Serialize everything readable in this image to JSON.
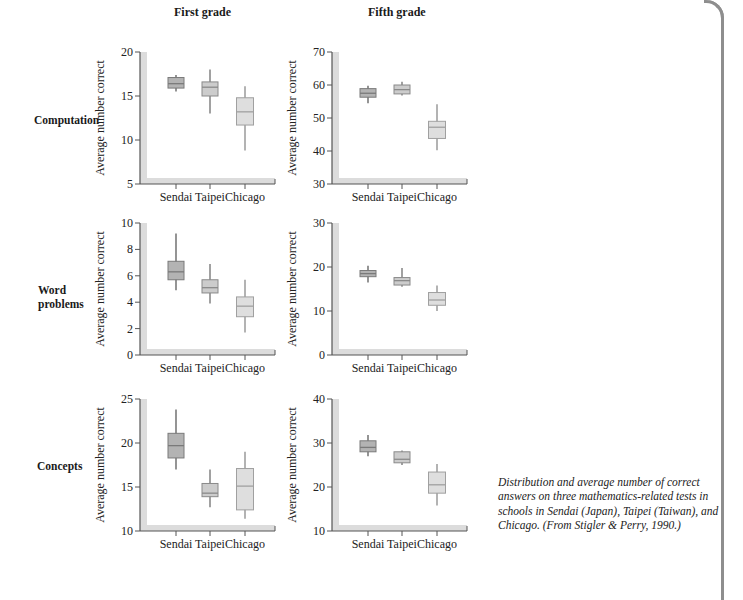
{
  "columns": [
    "First grade",
    "Fifth grade"
  ],
  "rows": [
    "Computation",
    "Word problems",
    "Concepts"
  ],
  "caption": "Distribution and average number of correct answers on three mathematics-related tests in schools in Sendai (Japan), Taipei (Taiwan), and Chicago. (From Stigler & Perry, 1990.)",
  "colors": {
    "sendai": "#b3b3b3",
    "taipei": "#cccccc",
    "chicago": "#dedede",
    "axis_bar": "#dcdcdc",
    "frame": "#8e8e8e"
  },
  "chart_data": [
    {
      "type": "boxplot",
      "title": "First grade",
      "row": "Computation",
      "ylabel": "Average number correct",
      "ylim": [
        5,
        20
      ],
      "yticks": [
        5,
        10,
        15,
        20
      ],
      "categories": [
        "Sendai",
        "Taipei",
        "Chicago"
      ],
      "boxes": [
        {
          "min": 15.5,
          "q1": 15.9,
          "median": 16.4,
          "q3": 17.1,
          "max": 17.4
        },
        {
          "min": 13.0,
          "q1": 15.0,
          "median": 16.0,
          "q3": 16.6,
          "max": 18.0
        },
        {
          "min": 8.8,
          "q1": 11.7,
          "median": 13.2,
          "q3": 14.8,
          "max": 16.1
        }
      ]
    },
    {
      "type": "boxplot",
      "title": "Fifth grade",
      "row": "Computation",
      "ylabel": "Average number correct",
      "ylim": [
        30,
        70
      ],
      "yticks": [
        30,
        40,
        50,
        60,
        70
      ],
      "categories": [
        "Sendai",
        "Taipei",
        "Chicago"
      ],
      "boxes": [
        {
          "min": 54.5,
          "q1": 56.3,
          "median": 57.5,
          "q3": 58.9,
          "max": 59.8
        },
        {
          "min": 56.8,
          "q1": 57.3,
          "median": 58.6,
          "q3": 60.0,
          "max": 61.0
        },
        {
          "min": 40.2,
          "q1": 43.8,
          "median": 47.2,
          "q3": 49.0,
          "max": 54.2
        }
      ]
    },
    {
      "type": "boxplot",
      "title": "First grade",
      "row": "Word problems",
      "ylabel": "Average number correct",
      "ylim": [
        0,
        10
      ],
      "yticks": [
        0,
        2,
        4,
        6,
        8,
        10
      ],
      "categories": [
        "Sendai",
        "Taipei",
        "Chicago"
      ],
      "boxes": [
        {
          "min": 4.9,
          "q1": 5.7,
          "median": 6.3,
          "q3": 7.1,
          "max": 9.2
        },
        {
          "min": 3.9,
          "q1": 4.7,
          "median": 5.1,
          "q3": 5.7,
          "max": 6.9
        },
        {
          "min": 1.7,
          "q1": 2.9,
          "median": 3.7,
          "q3": 4.4,
          "max": 5.7
        }
      ]
    },
    {
      "type": "boxplot",
      "title": "Fifth grade",
      "row": "Word problems",
      "ylabel": "Average number correct",
      "ylim": [
        0,
        30
      ],
      "yticks": [
        0,
        10,
        20,
        30
      ],
      "categories": [
        "Sendai",
        "Taipei",
        "Chicago"
      ],
      "boxes": [
        {
          "min": 16.5,
          "q1": 17.8,
          "median": 18.5,
          "q3": 19.2,
          "max": 20.3
        },
        {
          "min": 15.5,
          "q1": 15.9,
          "median": 16.9,
          "q3": 17.6,
          "max": 19.8
        },
        {
          "min": 10.0,
          "q1": 11.3,
          "median": 12.5,
          "q3": 14.2,
          "max": 15.8
        }
      ]
    },
    {
      "type": "boxplot",
      "title": "First grade",
      "row": "Concepts",
      "ylabel": "Average number correct",
      "ylim": [
        10,
        25
      ],
      "yticks": [
        10,
        15,
        20,
        25
      ],
      "categories": [
        "Sendai",
        "Taipei",
        "Chicago"
      ],
      "boxes": [
        {
          "min": 17.0,
          "q1": 18.3,
          "median": 19.7,
          "q3": 21.1,
          "max": 23.8
        },
        {
          "min": 12.7,
          "q1": 13.9,
          "median": 14.3,
          "q3": 15.4,
          "max": 17.0
        },
        {
          "min": 11.4,
          "q1": 12.4,
          "median": 15.1,
          "q3": 17.1,
          "max": 19.0
        }
      ]
    },
    {
      "type": "boxplot",
      "title": "Fifth grade",
      "row": "Concepts",
      "ylabel": "Average number correct",
      "ylim": [
        10,
        40
      ],
      "yticks": [
        10,
        20,
        30,
        40
      ],
      "categories": [
        "Sendai",
        "Taipei",
        "Chicago"
      ],
      "boxes": [
        {
          "min": 27.0,
          "q1": 28.0,
          "median": 29.0,
          "q3": 30.5,
          "max": 31.8
        },
        {
          "min": 25.0,
          "q1": 25.5,
          "median": 26.3,
          "q3": 28.0,
          "max": 28.3
        },
        {
          "min": 15.8,
          "q1": 18.6,
          "median": 20.5,
          "q3": 23.4,
          "max": 25.2
        }
      ]
    }
  ]
}
